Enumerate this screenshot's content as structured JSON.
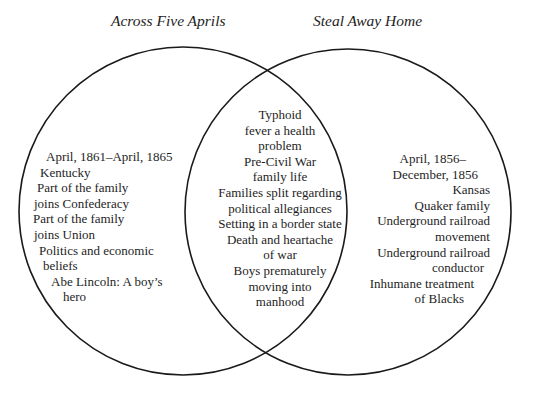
{
  "diagram": {
    "type": "venn",
    "sets": [
      {
        "id": "left",
        "label": "Across Five Aprils"
      },
      {
        "id": "right",
        "label": "Steal Away Home"
      }
    ],
    "left_only": {
      "lines": [
        {
          "text": "April, 1861–April, 1865",
          "indent": 10
        },
        {
          "text": "Kentucky",
          "indent": 4
        },
        {
          "text": "Part of the family",
          "indent": 1
        },
        {
          "text": "joins Confederacy",
          "indent": -2
        },
        {
          "text": "Part of the family",
          "indent": -3
        },
        {
          "text": "joins Union",
          "indent": -2
        },
        {
          "text": "Politics and economic",
          "indent": 3
        },
        {
          "text": "beliefs",
          "indent": 7
        },
        {
          "text": "Abe Lincoln: A boy’s",
          "indent": 15
        },
        {
          "text": "hero",
          "indent": 27
        }
      ]
    },
    "overlap": {
      "lines": [
        "Typhoid",
        "fever a health",
        "problem",
        "Pre-Civil War",
        "family life",
        "Families split regarding",
        "political allegiances",
        "Setting in a border state",
        "Death and heartache",
        "of war",
        "Boys prematurely",
        "moving into",
        "manhood"
      ]
    },
    "right_only": {
      "lines": [
        {
          "text": "April, 1856–",
          "indent": 24
        },
        {
          "text": "December, 1856",
          "indent": 12
        },
        {
          "text": "Kansas",
          "indent": 0
        },
        {
          "text": "Quaker family",
          "indent": 0
        },
        {
          "text": "Underground railroad",
          "indent": 0
        },
        {
          "text": "movement",
          "indent": 0
        },
        {
          "text": "Underground railroad",
          "indent": 0
        },
        {
          "text": "conductor",
          "indent": 0
        },
        {
          "text": "Inhumane treatment",
          "indent": 0
        },
        {
          "text": "of Blacks",
          "indent": 0
        }
      ]
    },
    "colors": {
      "stroke": "#1a1a1a",
      "text": "#1e1e1e",
      "background": "#ffffff"
    }
  }
}
